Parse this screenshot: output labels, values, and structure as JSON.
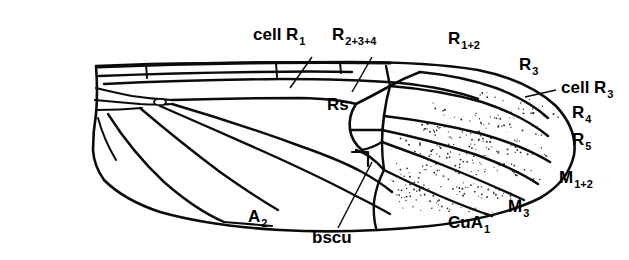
{
  "figure": {
    "kind": "insect-wing-venation-diagram",
    "background_color": "#ffffff",
    "ink_color": "#0b0b0b",
    "stipple_color": "#2b2b2b",
    "labels": [
      {
        "id": "cell-r1",
        "text": "cell R",
        "sub": "1",
        "x": 253,
        "y": 40,
        "anchor": "start"
      },
      {
        "id": "r2-3-4",
        "text": "R",
        "sub": "2+3+4",
        "x": 332,
        "y": 40,
        "anchor": "start"
      },
      {
        "id": "r1-2",
        "text": "R",
        "sub": "1+2",
        "x": 448,
        "y": 44,
        "anchor": "start"
      },
      {
        "id": "r3",
        "text": "R",
        "sub": "3",
        "x": 519,
        "y": 70,
        "anchor": "start"
      },
      {
        "id": "cell-r3",
        "text": "cell R",
        "sub": "3",
        "x": 561,
        "y": 93,
        "anchor": "start"
      },
      {
        "id": "r4",
        "text": "R",
        "sub": "4",
        "x": 572,
        "y": 118,
        "anchor": "start"
      },
      {
        "id": "r5",
        "text": "R",
        "sub": "5",
        "x": 572,
        "y": 145,
        "anchor": "start"
      },
      {
        "id": "m1-2",
        "text": "M",
        "sub": "1+2",
        "x": 559,
        "y": 183,
        "anchor": "start"
      },
      {
        "id": "m3",
        "text": "M",
        "sub": "3",
        "x": 508,
        "y": 212,
        "anchor": "start"
      },
      {
        "id": "cua1",
        "text": "CuA",
        "sub": "1",
        "x": 448,
        "y": 228,
        "anchor": "start"
      },
      {
        "id": "a2",
        "text": "A",
        "sub": "2",
        "x": 248,
        "y": 222,
        "anchor": "start"
      },
      {
        "id": "bscu",
        "text": "bscu",
        "sub": "",
        "x": 312,
        "y": 243,
        "anchor": "start"
      },
      {
        "id": "rs",
        "text": "Rs",
        "sub": "",
        "x": 327,
        "y": 110,
        "anchor": "start"
      }
    ],
    "leaders": [
      {
        "id": "leader-cell-r1",
        "x1": 312,
        "y1": 57,
        "x2": 290,
        "y2": 88
      },
      {
        "id": "leader-r2-3-4",
        "x1": 372,
        "y1": 57,
        "x2": 352,
        "y2": 92
      },
      {
        "id": "leader-cell-r3",
        "x1": 556,
        "y1": 90,
        "x2": 525,
        "y2": 97
      },
      {
        "id": "leader-bscu",
        "x1": 338,
        "y1": 228,
        "x2": 372,
        "y2": 162
      }
    ],
    "stipple_cells": [
      {
        "id": "stipple-r3",
        "seed": 11
      },
      {
        "id": "stipple-r4",
        "seed": 23
      },
      {
        "id": "stipple-r5",
        "seed": 37
      },
      {
        "id": "stipple-m1",
        "seed": 51
      },
      {
        "id": "stipple-m2",
        "seed": 67
      },
      {
        "id": "stipple-cua",
        "seed": 83
      }
    ]
  }
}
